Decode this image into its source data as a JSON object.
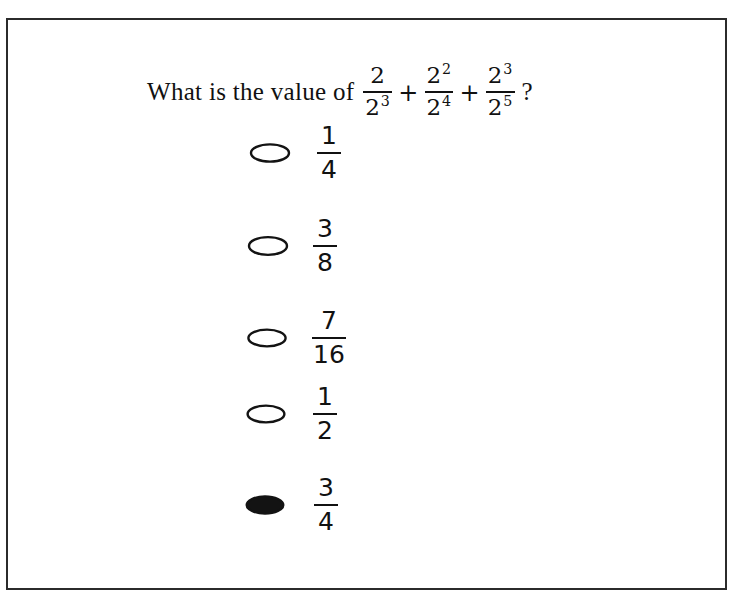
{
  "page": {
    "background_color": "#ffffff",
    "border_color": "#2b2b2b",
    "ink_color": "#111111"
  },
  "question": {
    "stem": "What is the value of",
    "question_mark": "?",
    "expression_plain": "2/2^3 + 2^2/2^4 + 2^3/2^5",
    "terms": [
      {
        "numerator_base": "2",
        "numerator_exponent": "",
        "denominator_base": "2",
        "denominator_exponent": "3"
      },
      {
        "numerator_base": "2",
        "numerator_exponent": "2",
        "denominator_base": "2",
        "denominator_exponent": "4"
      },
      {
        "numerator_base": "2",
        "numerator_exponent": "3",
        "denominator_base": "2",
        "denominator_exponent": "5"
      }
    ],
    "operators": [
      "+",
      "+"
    ]
  },
  "options": [
    {
      "index": 0,
      "numerator": "1",
      "denominator": "4",
      "value_plain": "1/4",
      "selected": false,
      "bubble": "empty-oval"
    },
    {
      "index": 1,
      "numerator": "3",
      "denominator": "8",
      "value_plain": "3/8",
      "selected": false,
      "bubble": "empty-oval"
    },
    {
      "index": 2,
      "numerator": "7",
      "denominator": "16",
      "value_plain": "7/16",
      "selected": false,
      "bubble": "empty-oval"
    },
    {
      "index": 3,
      "numerator": "1",
      "denominator": "2",
      "value_plain": "1/2",
      "selected": false,
      "bubble": "empty-oval"
    },
    {
      "index": 4,
      "numerator": "3",
      "denominator": "4",
      "value_plain": "3/4",
      "selected": true,
      "bubble": "filled-oval"
    }
  ]
}
